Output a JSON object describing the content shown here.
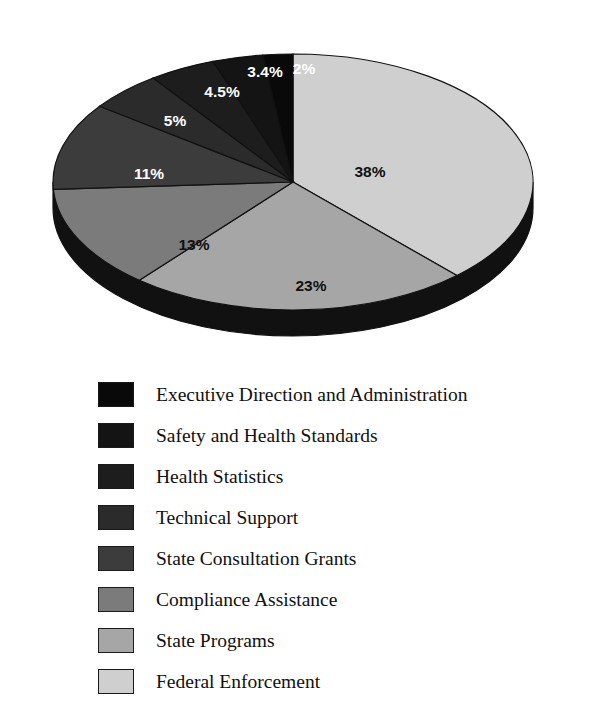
{
  "chart_data": {
    "type": "pie",
    "title": "",
    "subtitle": "",
    "xlabel": "",
    "ylabel": "",
    "grid": false,
    "legend_position": "bottom-left",
    "units": "percent",
    "start_angle_deg": 0,
    "direction": "clockwise",
    "three_d": true,
    "categories": [
      "Federal Enforcement",
      "State Programs",
      "Compliance Assistance",
      "State Consultation Grants",
      "Technical Support",
      "Health Statistics",
      "Safety and Health Standards",
      "Executive Direction and Administration"
    ],
    "values": [
      38,
      23,
      13,
      11,
      5,
      4.5,
      3.4,
      2
    ],
    "value_labels": [
      "38%",
      "23%",
      "13%",
      "11%",
      "5%",
      "4.5%",
      "3.4%",
      "2%"
    ],
    "slice_colors": [
      "#cfcfcf",
      "#a6a6a6",
      "#7b7b7b",
      "#3c3c3c",
      "#2b2b2b",
      "#1d1d1d",
      "#141414",
      "#090909"
    ],
    "label_text_colors": [
      "#111111",
      "#111111",
      "#111111",
      "#ffffff",
      "#ffffff",
      "#ffffff",
      "#ffffff",
      "#ffffff"
    ],
    "edge_color": "#111111",
    "side_color": "#111111",
    "background": "#ffffff"
  },
  "pie": {
    "slices": [
      {
        "name": "Federal Enforcement",
        "label": "38%",
        "value": 38,
        "color": "#cfcfcf",
        "label_on": "light",
        "lx": 352,
        "ly": 155
      },
      {
        "name": "State Programs",
        "label": "23%",
        "value": 23,
        "color": "#a6a6a6",
        "label_on": "light",
        "lx": 293,
        "ly": 269
      },
      {
        "name": "Compliance Assistance",
        "label": "13%",
        "value": 13,
        "color": "#7b7b7b",
        "label_on": "light",
        "lx": 176,
        "ly": 228
      },
      {
        "name": "State Consultation Grants",
        "label": "11%",
        "value": 11,
        "color": "#3c3c3c",
        "label_on": "dark",
        "lx": 131,
        "ly": 157
      },
      {
        "name": "Technical Support",
        "label": "5%",
        "value": 5,
        "color": "#2b2b2b",
        "label_on": "dark",
        "lx": 157,
        "ly": 104
      },
      {
        "name": "Health Statistics",
        "label": "4.5%",
        "value": 4.5,
        "color": "#1d1d1d",
        "label_on": "dark",
        "lx": 204,
        "ly": 75
      },
      {
        "name": "Safety and Health Standards",
        "label": "3.4%",
        "value": 3.4,
        "color": "#141414",
        "label_on": "dark",
        "lx": 247,
        "ly": 55
      },
      {
        "name": "Executive Direction and Administration",
        "label": "2%",
        "value": 2,
        "color": "#090909",
        "label_on": "dark",
        "lx": 286,
        "ly": 52
      }
    ]
  },
  "legend": {
    "items": [
      {
        "label": "Executive Direction and Administration",
        "color": "#090909"
      },
      {
        "label": "Safety and Health Standards",
        "color": "#141414"
      },
      {
        "label": "Health Statistics",
        "color": "#1d1d1d"
      },
      {
        "label": "Technical Support",
        "color": "#2b2b2b"
      },
      {
        "label": "State Consultation Grants",
        "color": "#3c3c3c"
      },
      {
        "label": "Compliance Assistance",
        "color": "#7b7b7b"
      },
      {
        "label": "State Programs",
        "color": "#a6a6a6"
      },
      {
        "label": "Federal Enforcement",
        "color": "#cfcfcf"
      }
    ]
  }
}
